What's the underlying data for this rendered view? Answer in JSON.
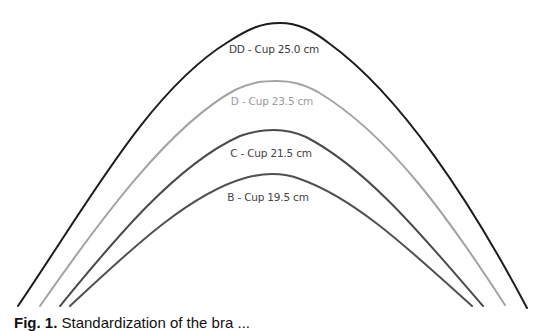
{
  "figure": {
    "curves": [
      {
        "id": "dd",
        "label": "DD - Cup  25.0 cm",
        "cup": "DD",
        "width_cm": 25.0,
        "color": "#1c1c1c",
        "label_color": "#3a3a3a",
        "path": "M18,306 C90,200 150,90 228,42 C250,28 262,23 280,23 C298,23 312,30 330,44 C400,95 470,200 527,308",
        "label_x": 274,
        "label_y": 43
      },
      {
        "id": "d",
        "label": "D - Cup  23.5 cm",
        "cup": "D",
        "width_cm": 23.5,
        "color": "#a3a3a3",
        "label_color": "#9a9a9a",
        "path": "M40,306 C100,220 170,125 235,90 C252,82 262,81 277,81 C292,81 303,84 318,92 C390,135 450,220 505,305",
        "label_x": 272,
        "label_y": 95
      },
      {
        "id": "c",
        "label": "C - Cup  21.5 cm",
        "cup": "C",
        "width_cm": 21.5,
        "color": "#4a4a4a",
        "label_color": "#444444",
        "path": "M60,306 C110,245 175,165 240,136 C254,131 262,130 274,130 C286,130 295,132 306,137 C370,170 430,245 483,306",
        "label_x": 271,
        "label_y": 147
      },
      {
        "id": "b",
        "label": "B - Cup  19.5 cm",
        "cup": "B",
        "width_cm": 19.5,
        "color": "#505050",
        "label_color": "#444444",
        "path": "M70,306 C120,260 185,195 245,178 C256,175 263,174 272,174 C281,174 290,175 300,179 C360,200 420,260 472,306",
        "label_x": 268,
        "label_y": 191
      }
    ],
    "caption": {
      "prefix": "Fig. 1.",
      "text": "Standardization of the bra ..."
    }
  }
}
